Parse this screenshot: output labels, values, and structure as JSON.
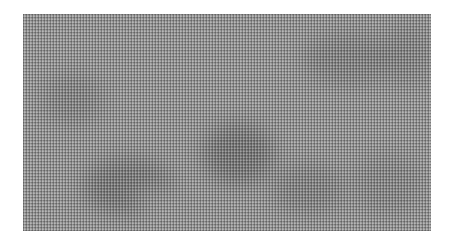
{
  "image": {
    "description": "Grayscale woven mesh texture with soft darker blotches",
    "base_color": "#9a9a9a",
    "blotch_color": "#5a5a5a",
    "blotches": [
      {
        "x": 60,
        "y": 145,
        "w": 90,
        "h": 55,
        "opacity": 0.55
      },
      {
        "x": 180,
        "y": 110,
        "w": 70,
        "h": 60,
        "opacity": 0.6
      },
      {
        "x": 250,
        "y": 150,
        "w": 70,
        "h": 50,
        "opacity": 0.35
      },
      {
        "x": 20,
        "y": 60,
        "w": 60,
        "h": 50,
        "opacity": 0.3
      },
      {
        "x": 280,
        "y": 20,
        "w": 90,
        "h": 50,
        "opacity": 0.35
      },
      {
        "x": 360,
        "y": 10,
        "w": 50,
        "h": 60,
        "opacity": 0.3
      },
      {
        "x": 330,
        "y": 140,
        "w": 70,
        "h": 60,
        "opacity": 0.25
      }
    ],
    "light_spots": [
      {
        "x": 110,
        "y": 170,
        "w": 40,
        "h": 30,
        "opacity": 0.3
      }
    ]
  }
}
